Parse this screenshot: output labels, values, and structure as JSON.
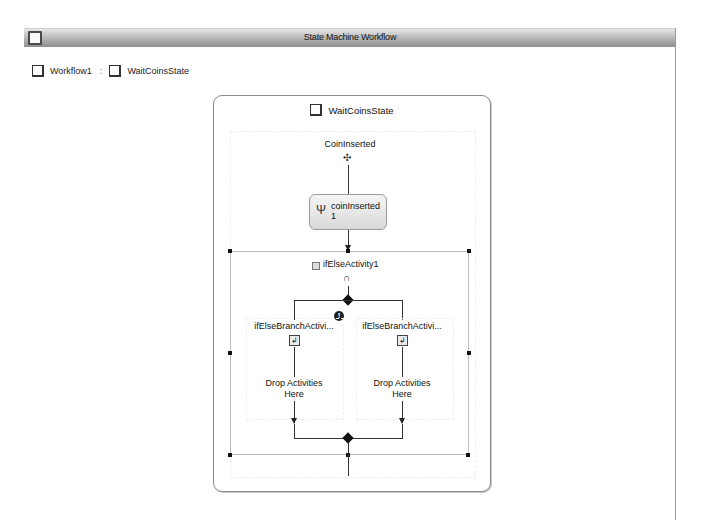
{
  "window": {
    "title": "State Machine Workflow"
  },
  "breadcrumb": {
    "items": [
      {
        "label": "Workflow1",
        "icon": "state-square-icon"
      },
      {
        "label": "WaitCoinsState",
        "icon": "state-square-icon"
      }
    ],
    "separator": ":"
  },
  "state": {
    "name": "WaitCoinsState",
    "icon": "state-square-icon",
    "event_driven": {
      "label": "CoinInserted",
      "icon": "event-driven-icon",
      "activity": {
        "label": "coinInserted1",
        "label_line1": "coinInserted",
        "label_line2": "1",
        "icon": "handle-external-event-icon"
      },
      "if_else": {
        "label": "ifElseActivity1",
        "icon": "if-else-icon",
        "warning_glyph": "!",
        "branches": [
          {
            "label": "ifElseBranchActivi...",
            "drop_text_line1": "Drop Activities",
            "drop_text_line2": "Here"
          },
          {
            "label": "ifElseBranchActivi...",
            "drop_text_line1": "Drop Activities",
            "drop_text_line2": "Here"
          }
        ]
      }
    }
  },
  "colors": {
    "titlebar_light": "#e6e6e6",
    "titlebar_dark": "#8e8e8e",
    "connector": "#333333",
    "selection_frame": "#bdbdbd",
    "activity_fill": "#d9d9d9"
  }
}
